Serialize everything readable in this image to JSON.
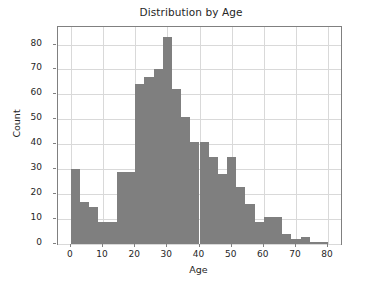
{
  "chart_data": {
    "type": "bar",
    "title": "Distribution by Age",
    "xlabel": "Age",
    "ylabel": "Count",
    "xlim": [
      -4,
      84
    ],
    "ylim": [
      0,
      87
    ],
    "grid": true,
    "legend": null,
    "bar_color": "#7f7f7f",
    "bin_width": 2.857,
    "xticks": [
      0,
      10,
      20,
      30,
      40,
      50,
      60,
      70,
      80
    ],
    "yticks": [
      0,
      10,
      20,
      30,
      40,
      50,
      60,
      70,
      80
    ],
    "xtick_labels": [
      "0",
      "10",
      "20",
      "30",
      "40",
      "50",
      "60",
      "70",
      "80"
    ],
    "ytick_labels": [
      "0",
      "10",
      "20",
      "30",
      "40",
      "50",
      "60",
      "70",
      "80"
    ],
    "bin_edges": [
      0,
      2.857,
      5.714,
      8.571,
      11.429,
      14.286,
      17.143,
      20,
      22.857,
      25.714,
      28.571,
      31.429,
      34.286,
      37.143,
      40,
      42.857,
      45.714,
      48.571,
      51.429,
      54.286,
      57.143,
      60,
      62.857,
      65.714,
      68.571,
      71.429,
      74.286,
      77.143,
      80
    ],
    "categories": [
      "0-2.9",
      "2.9-5.7",
      "5.7-8.6",
      "8.6-11.4",
      "11.4-14.3",
      "14.3-17.1",
      "17.1-20",
      "20-22.9",
      "22.9-25.7",
      "25.7-28.6",
      "28.6-31.4",
      "31.4-34.3",
      "34.3-37.1",
      "37.1-40",
      "40-42.9",
      "42.9-45.7",
      "45.7-48.6",
      "48.6-51.4",
      "51.4-54.3",
      "54.3-57.1",
      "57.1-60",
      "60-62.9",
      "62.9-65.7",
      "65.7-68.6",
      "68.6-71.4",
      "71.4-74.3",
      "74.3-77.1",
      "77.1-80"
    ],
    "values": [
      30,
      17,
      15,
      9,
      9,
      29,
      29,
      64,
      67,
      70,
      83,
      62,
      51,
      41,
      41,
      35,
      28,
      35,
      23,
      16,
      9,
      11,
      11,
      4,
      2,
      3,
      1,
      1
    ]
  }
}
